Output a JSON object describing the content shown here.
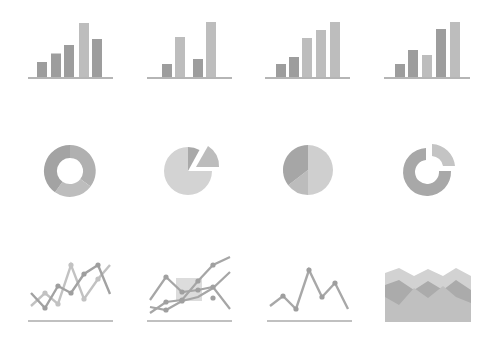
{
  "palette": {
    "background": "#ffffff",
    "dark": "#999999",
    "mid": "#acacac",
    "light": "#c2c2c2",
    "lighter": "#d6d6d6",
    "axis": "#b5b5b5"
  },
  "rows": [
    {
      "name": "bar-charts",
      "icons": [
        {
          "type": "bar",
          "name": "bar-chart-icon-1",
          "axis": [
            28,
            113,
            78
          ],
          "bars": [
            [
              37,
              62,
              "dark"
            ],
            [
              51,
              53.5,
              "dark"
            ],
            [
              64,
              45,
              "dark"
            ],
            [
              79,
              23,
              "light"
            ],
            [
              92,
              39,
              "dark"
            ]
          ]
        },
        {
          "type": "bar",
          "name": "bar-chart-icon-2",
          "axis": [
            147,
            232,
            78
          ],
          "bars": [
            [
              162,
              64,
              "dark"
            ],
            [
              175,
              37,
              "light"
            ],
            [
              193,
              59,
              "dark"
            ],
            [
              206,
              22,
              "light"
            ]
          ]
        },
        {
          "type": "bar",
          "name": "bar-chart-icon-3",
          "axis": [
            265,
            350,
            78
          ],
          "bars": [
            [
              276,
              64,
              "dark"
            ],
            [
              289,
              57,
              "dark"
            ],
            [
              302,
              38,
              "light"
            ],
            [
              316,
              30,
              "light"
            ],
            [
              330,
              22,
              "light"
            ]
          ]
        },
        {
          "type": "bar",
          "name": "bar-chart-icon-4",
          "axis": [
            384,
            470,
            78
          ],
          "bars": [
            [
              395,
              64,
              "dark"
            ],
            [
              408,
              50,
              "dark"
            ],
            [
              422,
              55,
              "light"
            ],
            [
              436,
              29,
              "dark"
            ],
            [
              450,
              22,
              "light"
            ]
          ]
        }
      ]
    },
    {
      "name": "pie-charts",
      "icons": [
        {
          "type": "donut",
          "name": "donut-chart-icon",
          "cx": 70,
          "cy": 171,
          "r": 26,
          "ir": 13
        },
        {
          "type": "exploded-pie",
          "name": "exploded-pie-chart-icon",
          "cx": 188,
          "cy": 171,
          "r": 24
        },
        {
          "type": "pie",
          "name": "pie-chart-icon",
          "cx": 308,
          "cy": 170,
          "r": 25
        },
        {
          "type": "split-donut",
          "name": "split-donut-chart-icon",
          "cx": 427,
          "cy": 171,
          "r": 24,
          "ir": 11
        }
      ]
    },
    {
      "name": "line-charts",
      "icons": [
        {
          "type": "line",
          "name": "line-chart-icon-1"
        },
        {
          "type": "line",
          "name": "multi-line-chart-icon"
        },
        {
          "type": "line",
          "name": "line-chart-icon-3"
        },
        {
          "type": "area",
          "name": "stacked-area-chart-icon"
        }
      ]
    }
  ]
}
